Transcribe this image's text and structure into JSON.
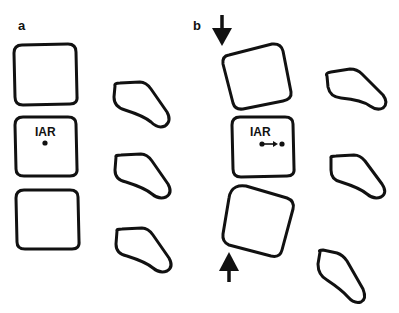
{
  "panels": [
    {
      "label": "a",
      "iar_label": "IAR",
      "description": "Neutral alignment; instantaneous axis of rotation shown as a single point",
      "arrows": []
    },
    {
      "label": "b",
      "iar_label": "IAR",
      "description": "Compressive load applied (arrows top and bottom); IAR shifted, shown with displacement arrow between two points",
      "arrows": [
        "arrow-down (top)",
        "arrow-up (bottom)"
      ]
    }
  ],
  "colors": {
    "stroke": "#111111",
    "background": "#ffffff"
  }
}
